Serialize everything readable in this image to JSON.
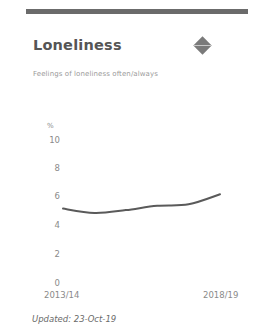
{
  "card": {
    "title": "Loneliness",
    "subtitle": "Feelings of loneliness often/always",
    "indicator_icon": "diamond-icon",
    "updated": "Updated: 23-Oct-19"
  },
  "colors": {
    "line": "#5a5a5a",
    "title": "#555555",
    "axis_text": "#8a8a8a",
    "indicator": "#7a7a7a"
  },
  "chart_data": {
    "type": "line",
    "title": "Loneliness",
    "subtitle": "Feelings of loneliness often/always",
    "xlabel": "",
    "ylabel": "%",
    "ylim": [
      0,
      10
    ],
    "yticks": [
      0,
      2,
      4,
      6,
      8,
      10
    ],
    "x": [
      "2013/14",
      "2014/15",
      "2015/16",
      "2016/17",
      "2017/18",
      "2018/19"
    ],
    "xtick_labels_shown": [
      "2013/14",
      "2018/19"
    ],
    "series": [
      {
        "name": "Loneliness",
        "values": [
          5.2,
          4.9,
          5.1,
          5.4,
          5.5,
          6.2
        ]
      }
    ],
    "grid": false,
    "legend": "none"
  }
}
